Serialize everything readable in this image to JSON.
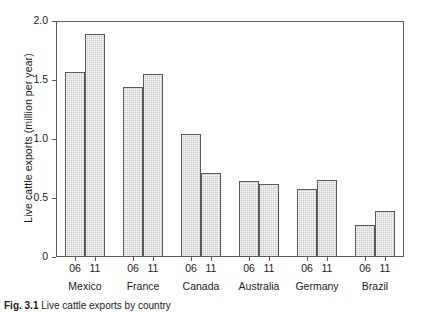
{
  "chart_data": {
    "type": "bar",
    "title": "",
    "xlabel": "",
    "ylabel": "Live cattle exports (million per year)",
    "ylim": [
      0,
      2.0
    ],
    "yticks": [
      "0",
      "0.5",
      "1.0",
      "1.5",
      "2.0"
    ],
    "ytick_values": [
      0,
      0.5,
      1.0,
      1.5,
      2.0
    ],
    "grid": false,
    "legend": "none",
    "categories": [
      "Mexico",
      "France",
      "Canada",
      "Australia",
      "Germany",
      "Brazil"
    ],
    "series": [
      {
        "name": "06",
        "values": [
          1.57,
          1.44,
          1.04,
          0.64,
          0.58,
          0.27
        ]
      },
      {
        "name": "11",
        "values": [
          1.89,
          1.55,
          0.71,
          0.62,
          0.65,
          0.39
        ]
      }
    ],
    "bar_color": "#c9c9c9",
    "bar_edge_color": "#5a5a5a",
    "axis_color": "#5a5a5a"
  },
  "caption": {
    "label": "Fig. 3.1",
    "text": "Live cattle exports by country"
  }
}
